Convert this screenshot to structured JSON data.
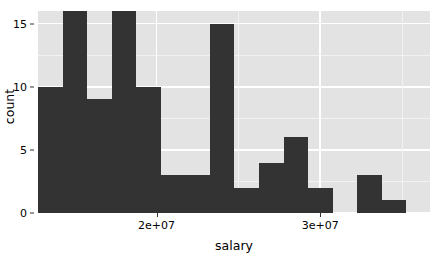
{
  "chart_data": {
    "type": "bar",
    "chart_subtype": "histogram",
    "title": "",
    "subtitle": "",
    "xlabel": "salary",
    "ylabel": "count",
    "grid": true,
    "legend": false,
    "legend_position": "none",
    "bar_color": "#333333",
    "panel_background": "#e3e3e3",
    "gridline_color": "#ffffff",
    "xlim": [
      12760000,
      36710000
    ],
    "ylim": [
      0,
      16
    ],
    "x_ticks": [
      20000000,
      30000000
    ],
    "x_tick_labels": [
      "2e+07",
      "3e+07"
    ],
    "y_ticks": [
      0,
      5,
      10,
      15
    ],
    "y_tick_labels": [
      "0",
      "5",
      "10",
      "15"
    ],
    "binwidth": 1500000,
    "bin_starts": [
      12760000,
      14260000,
      15760000,
      17260000,
      18760000,
      20260000,
      21760000,
      23260000,
      24760000,
      26260000,
      27760000,
      29260000,
      30760000,
      32260000,
      33760000,
      35260000
    ],
    "categories": [
      "12.8M",
      "14.3M",
      "15.8M",
      "17.3M",
      "18.8M",
      "20.3M",
      "21.8M",
      "23.3M",
      "24.8M",
      "26.3M",
      "27.8M",
      "29.3M",
      "30.8M",
      "32.3M",
      "33.8M"
    ],
    "values": [
      10,
      16,
      9,
      16,
      10,
      3,
      3,
      15,
      2,
      4,
      6,
      2,
      0,
      3,
      1
    ]
  },
  "axes": {
    "y_title": "count",
    "x_title": "salary"
  }
}
